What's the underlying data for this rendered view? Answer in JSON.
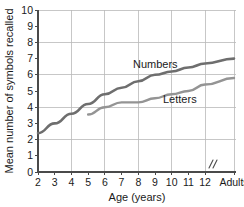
{
  "chart_data": {
    "type": "line",
    "title": "",
    "xlabel": "Age (years)",
    "ylabel": "Mean number of symbols recalled",
    "ylim": [
      0,
      10
    ],
    "ytick_step": 1,
    "ygrid_step": 2,
    "grid": true,
    "legend": "inline-labels",
    "x_tick_labels": [
      "2",
      "3",
      "4",
      "5",
      "6",
      "7",
      "8",
      "9",
      "10",
      "11",
      "12",
      "Adults"
    ],
    "axis_break": "//",
    "axis_break_note": "break between age 12 and Adults",
    "yticks": [
      "0",
      "1",
      "2",
      "3",
      "4",
      "5",
      "6",
      "7",
      "8",
      "9",
      "10"
    ],
    "series": [
      {
        "name": "Numbers",
        "color": "#6e6e6e",
        "label_text": "Numbers",
        "x": [
          "2",
          "3",
          "4",
          "5",
          "6",
          "7",
          "8",
          "9",
          "10",
          "11",
          "12",
          "Adults"
        ],
        "values": [
          2.4,
          3.0,
          3.6,
          4.2,
          4.8,
          5.2,
          5.6,
          6.0,
          6.2,
          6.45,
          6.7,
          7.0
        ]
      },
      {
        "name": "Letters",
        "color": "#949494",
        "label_text": "Letters",
        "x": [
          "5",
          "6",
          "7",
          "8",
          "9",
          "10",
          "11",
          "12",
          "Adults"
        ],
        "values": [
          3.55,
          4.0,
          4.3,
          4.3,
          4.55,
          4.8,
          5.0,
          5.4,
          5.8
        ]
      }
    ]
  },
  "colors": {
    "numbers_line": "#6e6e6e",
    "letters_line": "#949494",
    "grid": "#b9b9b9",
    "axis": "#4a4a4a",
    "text": "#1a1a1a",
    "background": "#ffffff"
  }
}
